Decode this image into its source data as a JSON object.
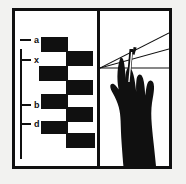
{
  "figure": {
    "background_color": "#f2f2f0",
    "ink_color": "#101010",
    "paper_color": "#ffffff",
    "panel_count": 2
  },
  "left_panel": {
    "name": "band-ladder-diagram",
    "axis": {
      "label": "",
      "orientation": "vertical"
    },
    "markers": [
      {
        "label": "a",
        "y": 29
      },
      {
        "label": "x",
        "y": 49
      },
      {
        "label": "b",
        "y": 94
      },
      {
        "label": "d",
        "y": 113
      }
    ],
    "bands": [
      {
        "lane": 1,
        "x": 26,
        "y": 26,
        "w": 27,
        "h": 15
      },
      {
        "lane": 2,
        "x": 51,
        "y": 40,
        "w": 27,
        "h": 15
      },
      {
        "lane": 1,
        "x": 24,
        "y": 55,
        "w": 29,
        "h": 15
      },
      {
        "lane": 2,
        "x": 51,
        "y": 69,
        "w": 27,
        "h": 15
      },
      {
        "lane": 1,
        "x": 26,
        "y": 83,
        "w": 27,
        "h": 15
      },
      {
        "lane": 2,
        "x": 51,
        "y": 96,
        "w": 27,
        "h": 15
      },
      {
        "lane": 1,
        "x": 26,
        "y": 110,
        "w": 27,
        "h": 13
      },
      {
        "lane": 2,
        "x": 51,
        "y": 122,
        "w": 29,
        "h": 15
      }
    ]
  },
  "right_panel": {
    "name": "hand-holding-instrument",
    "converging_lines": {
      "vertex_x": 0,
      "vertex_y": 57,
      "line_endpoints_y": [
        22,
        38,
        57
      ]
    },
    "horizon_line_y": 57,
    "instrument": "thin pointed tool",
    "subject": "hand silhouette"
  }
}
